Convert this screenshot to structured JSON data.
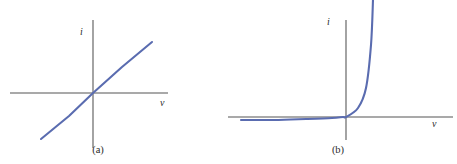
{
  "figure": {
    "background_color": "#ffffff",
    "axis_color": "#8d8d8d",
    "trace_color": "#5a6cb0",
    "label_color": "#2b2b2b"
  },
  "panels": [
    {
      "id": "a",
      "caption": "(a)",
      "y_axis_label": "i",
      "x_axis_label": "v",
      "chart_data": {
        "type": "line",
        "title": "",
        "subtitle": "",
        "xlabel": "v",
        "ylabel": "i",
        "description": "Linear (ohmic) current-voltage characteristic: current is directly proportional to voltage, a straight line of positive slope through the origin.",
        "grid": false,
        "legend": null,
        "axes": {
          "x_origin_px": 93,
          "y_origin_px": 93,
          "x_range_px": [
            10,
            168
          ],
          "y_range_px": [
            20,
            148
          ],
          "x_axis_arrow": false,
          "y_axis_arrow": false
        },
        "xlim": [
          -1,
          1
        ],
        "ylim": [
          -1,
          1
        ],
        "x_ticks": [],
        "y_ticks": [],
        "series": [
          {
            "name": "linear resistor",
            "x": [
              -0.66,
              -0.33,
              0,
              0.33,
              0.66
            ],
            "y": [
              -0.72,
              -0.36,
              0,
              0.4,
              0.8
            ],
            "points_px": [
              [
                41,
                139
              ],
              [
                69,
                116
              ],
              [
                93,
                93
              ],
              [
                122,
                67
              ],
              [
                152,
                42
              ]
            ],
            "slope": 1.2,
            "stroke_width_px": 2.1
          }
        ]
      }
    },
    {
      "id": "b",
      "caption": "(b)",
      "y_axis_label": "i",
      "x_axis_label": "v",
      "chart_data": {
        "type": "line",
        "title": "",
        "subtitle": "",
        "xlabel": "v",
        "ylabel": "i",
        "description": "Exponential diode current-voltage characteristic: small constant negative (reverse saturation) current for negative voltage, sharp knee near the origin, then steeply rising current for positive voltage.",
        "grid": false,
        "legend": null,
        "axes": {
          "x_origin_px": 118,
          "y_origin_px": 117,
          "x_range_px": [
            0,
            225
          ],
          "y_range_px": [
            20,
            140
          ],
          "x_axis_arrow": false,
          "y_axis_arrow": false
        },
        "xlim": [
          -1,
          0.55
        ],
        "ylim": [
          -0.05,
          1.2
        ],
        "x_ticks": [],
        "y_ticks": [],
        "series": [
          {
            "name": "diode exponential",
            "x": [
              -0.95,
              -0.7,
              -0.45,
              -0.2,
              -0.05,
              0,
              0.08,
              0.16,
              0.24,
              0.3
            ],
            "y": [
              -0.03,
              -0.03,
              -0.028,
              -0.02,
              -0.008,
              0,
              0.08,
              0.3,
              0.75,
              1.15
            ],
            "points_px": [
              [
                13,
                120
              ],
              [
                46,
                120
              ],
              [
                78,
                119
              ],
              [
                104,
                118
              ],
              [
                115,
                117
              ],
              [
                118,
                117
              ],
              [
                130,
                108
              ],
              [
                138,
                88
              ],
              [
                143,
                45
              ],
              [
                145,
                0
              ]
            ],
            "stroke_width_px": 2.1
          }
        ]
      }
    }
  ]
}
